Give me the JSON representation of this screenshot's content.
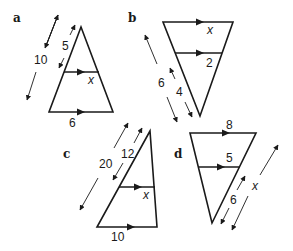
{
  "figure": {
    "colors": {
      "ink": "#1a1a1a",
      "background": "#ffffff"
    }
  },
  "panels": [
    {
      "id": "a",
      "label": "a",
      "side_outer": "10",
      "side_inner": "5",
      "base": "6",
      "unknown": "x"
    },
    {
      "id": "b",
      "label": "b",
      "side_outer": "6",
      "side_inner": "4",
      "parallel_inner": "2",
      "unknown": "x"
    },
    {
      "id": "c",
      "label": "c",
      "side_outer": "20",
      "side_inner": "12",
      "base": "10",
      "unknown": "x"
    },
    {
      "id": "d",
      "label": "d",
      "side_inner": "6",
      "top": "8",
      "parallel_inner": "5",
      "unknown": "x"
    }
  ]
}
